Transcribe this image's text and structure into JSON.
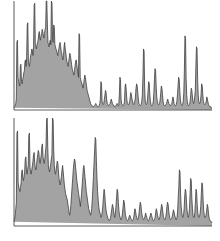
{
  "figure": {
    "title": "",
    "background_color": "#ffffff",
    "width": 220,
    "height": 241,
    "panel_count": 2
  },
  "style": {
    "fill_color": "#a3a3a3",
    "line_color": "#3f3f3f",
    "axis_color": "#4a4a4a",
    "line_width": 0.8
  },
  "chart_data": [
    {
      "type": "area",
      "title": "",
      "subtitle": "",
      "xlabel": "",
      "ylabel": "",
      "panel": "top",
      "grid": false,
      "legend": null,
      "legend_position": "none",
      "axis": {
        "x_visible_ticks": [],
        "y_visible_ticks": [],
        "xlim": [
          0,
          199
        ],
        "ylim": [
          0,
          100
        ],
        "baseline_visible": true,
        "left_spine_visible": true
      },
      "x": [
        0,
        1,
        2,
        3,
        4,
        5,
        6,
        7,
        8,
        9,
        10,
        11,
        12,
        13,
        14,
        15,
        16,
        17,
        18,
        19,
        20,
        21,
        22,
        23,
        24,
        25,
        26,
        27,
        28,
        29,
        30,
        31,
        32,
        33,
        34,
        35,
        36,
        37,
        38,
        39,
        40,
        41,
        42,
        43,
        44,
        45,
        46,
        47,
        48,
        49,
        50,
        51,
        52,
        53,
        54,
        55,
        56,
        57,
        58,
        59,
        60,
        61,
        62,
        63,
        64,
        65,
        66,
        67,
        68,
        69,
        70,
        71,
        72,
        73,
        74,
        75,
        76,
        77,
        78,
        79,
        80,
        81,
        82,
        83,
        84,
        85,
        86,
        87,
        88,
        89,
        90,
        91,
        92,
        93,
        94,
        95,
        96,
        97,
        98,
        99,
        100,
        101,
        102,
        103,
        104,
        105,
        106,
        107,
        108,
        109,
        110,
        111,
        112,
        113,
        114,
        115,
        116,
        117,
        118,
        119,
        120,
        121,
        122,
        123,
        124,
        125,
        126,
        127,
        128,
        129,
        130,
        131,
        132,
        133,
        134,
        135,
        136,
        137,
        138,
        139,
        140,
        141,
        142,
        143,
        144,
        145,
        146,
        147,
        148,
        149,
        150,
        151,
        152,
        153,
        154,
        155,
        156,
        157,
        158,
        159,
        160,
        161,
        162,
        163,
        164,
        165,
        166,
        167,
        168,
        169,
        170,
        171,
        172,
        173,
        174,
        175,
        176,
        177,
        178,
        179,
        180,
        181,
        182,
        183,
        184,
        185,
        186,
        187,
        188,
        189,
        190,
        191,
        192,
        193,
        194,
        195,
        196,
        197,
        198,
        199
      ],
      "values": [
        2,
        3,
        4,
        6,
        10,
        62,
        64,
        30,
        26,
        24,
        22,
        40,
        42,
        26,
        24,
        28,
        30,
        34,
        36,
        44,
        46,
        40,
        48,
        78,
        80,
        44,
        42,
        40,
        46,
        50,
        52,
        56,
        54,
        50,
        58,
        96,
        98,
        60,
        58,
        56,
        60,
        62,
        64,
        70,
        72,
        66,
        64,
        68,
        70,
        74,
        72,
        68,
        66,
        70,
        74,
        76,
        100,
        100,
        78,
        62,
        60,
        58,
        62,
        64,
        60,
        100,
        98,
        64,
        62,
        78,
        76,
        60,
        58,
        56,
        54,
        52,
        50,
        54,
        56,
        60,
        62,
        58,
        54,
        52,
        48,
        46,
        50,
        58,
        62,
        56,
        52,
        48,
        44,
        42,
        40,
        44,
        48,
        52,
        50,
        46,
        42,
        38,
        36,
        34,
        32,
        36,
        40,
        44,
        46,
        42,
        38,
        34,
        30,
        70,
        68,
        30,
        28,
        26,
        24,
        22,
        20,
        24,
        28,
        32,
        30,
        26,
        22,
        18,
        16,
        14,
        12,
        10,
        8,
        6,
        5,
        4,
        4,
        3,
        3,
        3,
        4,
        5,
        6,
        5,
        4,
        3,
        3,
        3,
        4,
        6,
        10,
        26,
        24,
        8,
        6,
        5,
        6,
        10,
        14,
        18,
        16,
        10,
        6,
        5,
        4,
        4,
        5,
        6,
        8,
        10,
        8,
        6,
        5,
        4,
        4,
        3,
        3,
        4,
        5,
        6,
        5,
        4,
        4,
        14,
        30,
        28,
        10,
        6,
        5,
        4,
        4,
        5,
        8,
        22,
        24,
        18,
        10,
        6,
        5,
        5,
        6,
        8,
        12,
        16,
        14,
        10,
        8,
        6,
        5,
        6,
        8,
        12,
        20,
        24,
        22,
        16,
        10,
        6,
        5,
        4,
        4,
        5,
        8,
        14,
        30,
        56,
        54,
        20,
        8,
        6,
        5,
        6,
        10,
        18,
        26,
        24,
        14,
        8,
        5,
        4,
        4,
        5,
        8,
        16,
        28,
        38,
        36,
        22,
        12,
        8,
        6,
        5,
        5,
        6,
        10,
        16,
        22,
        20,
        14,
        8,
        5,
        4,
        4,
        4,
        5,
        6,
        8,
        10,
        8,
        6,
        5,
        4,
        4,
        5,
        6,
        8,
        12,
        10,
        6,
        5,
        4,
        4,
        5,
        8,
        14,
        22,
        30,
        28,
        18,
        10,
        6,
        5,
        4,
        5,
        8,
        16,
        36,
        68,
        66,
        30,
        14,
        8,
        5,
        4,
        4,
        5,
        8,
        14,
        20,
        18,
        12,
        8,
        6,
        8,
        12,
        18,
        40,
        58,
        56,
        28,
        14,
        8,
        6,
        6,
        8,
        14,
        24,
        22,
        14,
        8,
        6,
        5,
        5,
        6,
        8,
        12,
        10,
        7,
        5,
        4,
        3,
        3,
        3,
        2,
        2
      ]
    },
    {
      "type": "area",
      "title": "",
      "subtitle": "",
      "xlabel": "",
      "ylabel": "",
      "panel": "bottom",
      "grid": false,
      "legend": null,
      "legend_position": "none",
      "axis": {
        "x_visible_ticks": [],
        "y_visible_ticks": [],
        "xlim": [
          0,
          199
        ],
        "ylim": [
          0,
          100
        ],
        "baseline_visible": true,
        "left_spine_visible": true
      },
      "x": [
        0,
        1,
        2,
        3,
        4,
        5,
        6,
        7,
        8,
        9,
        10,
        11,
        12,
        13,
        14,
        15,
        16,
        17,
        18,
        19,
        20,
        21,
        22,
        23,
        24,
        25,
        26,
        27,
        28,
        29,
        30,
        31,
        32,
        33,
        34,
        35,
        36,
        37,
        38,
        39,
        40,
        41,
        42,
        43,
        44,
        45,
        46,
        47,
        48,
        49,
        50,
        51,
        52,
        53,
        54,
        55,
        56,
        57,
        58,
        59,
        60,
        61,
        62,
        63,
        64,
        65,
        66,
        67,
        68,
        69,
        70,
        71,
        72,
        73,
        74,
        75,
        76,
        77,
        78,
        79,
        80,
        81,
        82,
        83,
        84,
        85,
        86,
        87,
        88,
        89,
        90,
        91,
        92,
        93,
        94,
        95,
        96,
        97,
        98,
        99,
        100,
        101,
        102,
        103,
        104,
        105,
        106,
        107,
        108,
        109,
        110,
        111,
        112,
        113,
        114,
        115,
        116,
        117,
        118,
        119,
        120,
        121,
        122,
        123,
        124,
        125,
        126,
        127,
        128,
        129,
        130,
        131,
        132,
        133,
        134,
        135,
        136,
        137,
        138,
        139,
        140,
        141,
        142,
        143,
        144,
        145,
        146,
        147,
        148,
        149,
        150,
        151,
        152,
        153,
        154,
        155,
        156,
        157,
        158,
        159,
        160,
        161,
        162,
        163,
        164,
        165,
        166,
        167,
        168,
        169,
        170,
        171,
        172,
        173,
        174,
        175,
        176,
        177,
        178,
        179,
        180,
        181,
        182,
        183,
        184,
        185,
        186,
        187,
        188,
        189,
        190,
        191,
        192,
        193,
        194,
        195,
        196,
        197,
        198,
        199
      ],
      "values": [
        4,
        6,
        10,
        16,
        22,
        86,
        88,
        40,
        36,
        34,
        32,
        36,
        40,
        50,
        52,
        44,
        42,
        46,
        50,
        62,
        64,
        52,
        48,
        52,
        56,
        84,
        86,
        54,
        50,
        48,
        52,
        56,
        60,
        66,
        68,
        58,
        54,
        52,
        56,
        62,
        66,
        70,
        68,
        60,
        58,
        62,
        66,
        74,
        76,
        64,
        60,
        58,
        62,
        68,
        74,
        98,
        100,
        72,
        56,
        52,
        50,
        54,
        58,
        62,
        66,
        100,
        98,
        70,
        56,
        50,
        48,
        52,
        56,
        60,
        58,
        50,
        44,
        40,
        38,
        42,
        46,
        52,
        56,
        50,
        44,
        38,
        34,
        30,
        28,
        26,
        24,
        20,
        16,
        12,
        10,
        14,
        20,
        28,
        36,
        44,
        52,
        58,
        62,
        60,
        54,
        48,
        42,
        38,
        34,
        30,
        26,
        22,
        18,
        24,
        30,
        38,
        46,
        54,
        56,
        50,
        44,
        38,
        32,
        28,
        24,
        20,
        16,
        14,
        12,
        10,
        12,
        16,
        24,
        34,
        46,
        58,
        70,
        82,
        80,
        60,
        44,
        32,
        24,
        18,
        14,
        12,
        10,
        8,
        10,
        14,
        20,
        28,
        34,
        30,
        22,
        16,
        12,
        10,
        8,
        6,
        6,
        5,
        6,
        8,
        12,
        16,
        20,
        18,
        14,
        10,
        8,
        12,
        18,
        26,
        34,
        32,
        22,
        14,
        10,
        8,
        6,
        6,
        8,
        12,
        18,
        24,
        22,
        16,
        10,
        8,
        6,
        5,
        5,
        6,
        8,
        10,
        9,
        7,
        6,
        5,
        5,
        6,
        8,
        12,
        16,
        14,
        10,
        8,
        6,
        6,
        8,
        12,
        18,
        22,
        20,
        14,
        10,
        8,
        6,
        6,
        7,
        9,
        12,
        10,
        8,
        6,
        5,
        5,
        6,
        8,
        10,
        12,
        10,
        8,
        6,
        5,
        5,
        6,
        8,
        12,
        16,
        14,
        10,
        8,
        6,
        6,
        8,
        12,
        16,
        20,
        18,
        13,
        9,
        7,
        6,
        6,
        8,
        12,
        18,
        22,
        20,
        14,
        10,
        7,
        6,
        6,
        7,
        9,
        12,
        15,
        13,
        10,
        8,
        6,
        6,
        8,
        14,
        26,
        36,
        52,
        50,
        30,
        18,
        12,
        9,
        8,
        10,
        16,
        28,
        34,
        32,
        22,
        14,
        10,
        8,
        10,
        16,
        30,
        44,
        42,
        26,
        16,
        10,
        8,
        8,
        12,
        22,
        34,
        32,
        20,
        12,
        9,
        8,
        9,
        12,
        18,
        30,
        40,
        38,
        24,
        14,
        10,
        8,
        8,
        10,
        14,
        20,
        18,
        12,
        8,
        6,
        5,
        4,
        4,
        3
      ]
    }
  ]
}
